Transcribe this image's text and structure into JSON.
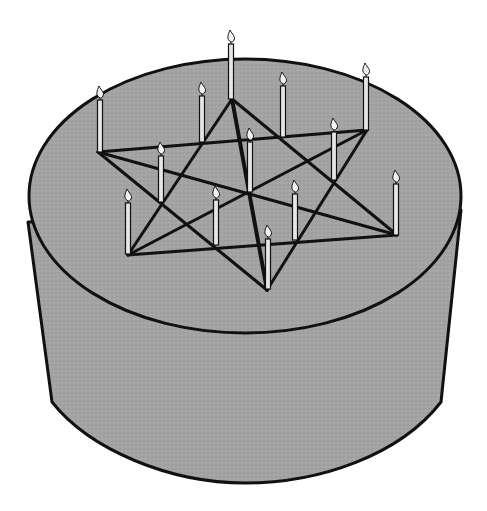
{
  "figure": {
    "colors": {
      "background": "#ffffff",
      "cake_fill": "#a3a3a3",
      "outline": "#111111",
      "candle_fill": "#e6e6e6",
      "flame_fill": "#f2f2f2"
    },
    "cake": {
      "top_ellipse": {
        "cx": 245,
        "cy": 196,
        "rx": 216,
        "ry": 137
      },
      "side_left_top": [
        28,
        222
      ],
      "side_right_top": [
        461,
        210
      ],
      "bottom_y": 483
    },
    "vertices": {
      "A": [
        232,
        99
      ],
      "B": [
        98,
        152
      ],
      "C": [
        367,
        130
      ],
      "D": [
        128,
        255
      ],
      "E": [
        397,
        235
      ],
      "F": [
        267,
        290
      ]
    },
    "lines": [
      [
        "B",
        "C"
      ],
      [
        "D",
        "E"
      ],
      [
        "A",
        "D"
      ],
      [
        "A",
        "F"
      ],
      [
        "A",
        "E"
      ],
      [
        "B",
        "E"
      ],
      [
        "B",
        "F"
      ],
      [
        "C",
        "D"
      ],
      [
        "C",
        "F"
      ]
    ],
    "candles": [
      {
        "x": 100,
        "top": 86,
        "base": 152
      },
      {
        "x": 202,
        "top": 82,
        "base": 142
      },
      {
        "x": 231,
        "top": 30,
        "base": 99
      },
      {
        "x": 283,
        "top": 72,
        "base": 137
      },
      {
        "x": 366,
        "top": 63,
        "base": 130
      },
      {
        "x": 161,
        "top": 142,
        "base": 202
      },
      {
        "x": 250,
        "top": 128,
        "base": 192
      },
      {
        "x": 334,
        "top": 118,
        "base": 180
      },
      {
        "x": 128,
        "top": 189,
        "base": 254
      },
      {
        "x": 216,
        "top": 186,
        "base": 245
      },
      {
        "x": 295,
        "top": 180,
        "base": 240
      },
      {
        "x": 396,
        "top": 170,
        "base": 235
      },
      {
        "x": 268,
        "top": 225,
        "base": 289
      }
    ]
  }
}
